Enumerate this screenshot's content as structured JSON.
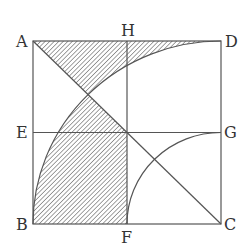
{
  "diagram": {
    "type": "geometry",
    "points": {
      "A": {
        "label": "A",
        "x": 33,
        "y": 41
      },
      "H": {
        "label": "H",
        "x": 127,
        "y": 41
      },
      "D": {
        "label": "D",
        "x": 221,
        "y": 41
      },
      "E": {
        "label": "E",
        "x": 33,
        "y": 132.5
      },
      "G": {
        "label": "G",
        "x": 221,
        "y": 132.5
      },
      "B": {
        "label": "B",
        "x": 33,
        "y": 224
      },
      "F": {
        "label": "F",
        "x": 127,
        "y": 224
      },
      "C": {
        "label": "C",
        "x": 221,
        "y": 224
      }
    },
    "segments": [
      "AD",
      "DC",
      "CB",
      "BA",
      "HF",
      "EG",
      "AC"
    ],
    "arcs": [
      {
        "center": "C",
        "from": "B",
        "to": "D",
        "name": "large-quarter-arc"
      },
      {
        "center": "C",
        "from": "F",
        "to": "G",
        "name": "small-quarter-arc"
      }
    ],
    "shaded_regions": [
      "region near top edge bounded by AD, diagonal AC and large arc",
      "region inside large arc, below diagonal AC, left of HF, outside small arc"
    ],
    "colors": {
      "line": "#555555",
      "hatch": "#555555",
      "label": "#333333",
      "background": "#ffffff"
    }
  }
}
